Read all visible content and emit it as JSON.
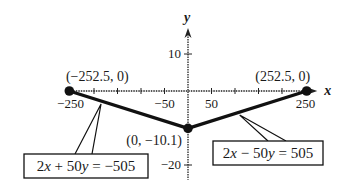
{
  "chart_data": {
    "type": "line",
    "title": "",
    "xlabel": "x",
    "ylabel": "y",
    "xlim": [
      -260,
      275
    ],
    "ylim": [
      -24,
      17
    ],
    "grid": false,
    "x_ticks": [
      -250,
      -200,
      -150,
      -100,
      -50,
      50,
      100,
      150,
      200,
      250
    ],
    "x_tick_labels": [
      {
        "value": -250,
        "text": "−250"
      },
      {
        "value": -50,
        "text": "−50"
      },
      {
        "value": 50,
        "text": "50"
      },
      {
        "value": 250,
        "text": "250"
      }
    ],
    "y_ticks": [
      10,
      -20
    ],
    "y_tick_labels": [
      {
        "value": 10,
        "text": "10"
      },
      {
        "value": -20,
        "text": "−20"
      }
    ],
    "series": [
      {
        "name": "2x + 50y = −505",
        "points": [
          [
            -252.5,
            0
          ],
          [
            0,
            -10.1
          ]
        ]
      },
      {
        "name": "2x − 50y = 505",
        "points": [
          [
            0,
            -10.1
          ],
          [
            252.5,
            0
          ]
        ]
      }
    ],
    "points": [
      {
        "x": -252.5,
        "y": 0,
        "label": "(−252.5, 0)"
      },
      {
        "x": 252.5,
        "y": 0,
        "label": "(252.5, 0)"
      },
      {
        "x": 0,
        "y": -10.1,
        "label": "(0, −10.1)"
      }
    ],
    "annotations": [
      {
        "text": "2x + 50y = −505",
        "series": 0
      },
      {
        "text": "2x − 50y = 505",
        "series": 1
      }
    ]
  }
}
